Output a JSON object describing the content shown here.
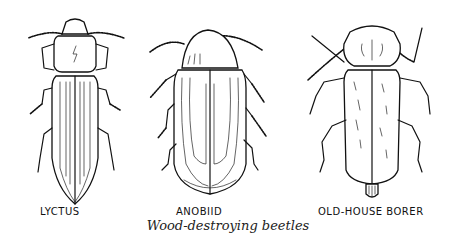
{
  "figure": {
    "caption": "Wood-destroying beetles",
    "beetles": [
      {
        "name": "lyctus",
        "label": "LYCTUS"
      },
      {
        "name": "anobiid",
        "label": "ANOBIID"
      },
      {
        "name": "old-house-borer",
        "label": "OLD-HOUSE BORER"
      }
    ]
  },
  "colors": {
    "ink": "#111111",
    "background": "#ffffff"
  }
}
